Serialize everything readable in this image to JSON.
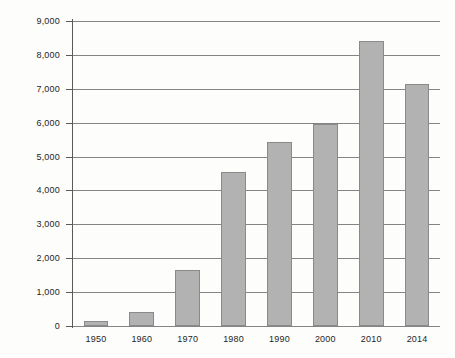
{
  "chart_data": {
    "type": "bar",
    "title": "",
    "xlabel": "",
    "ylabel": "Enrollment (1,000)",
    "categories": [
      "1950",
      "1960",
      "1970",
      "1980",
      "1990",
      "2000",
      "2010",
      "2014"
    ],
    "values": [
      150,
      410,
      1660,
      4540,
      5430,
      5970,
      8400,
      7140
    ],
    "ylim": [
      0,
      9000
    ],
    "ytick_labels": [
      "9,000",
      "8,000",
      "7,000",
      "6,000",
      "5,000",
      "4,000",
      "3,000",
      "2,000",
      "1,000",
      "0"
    ],
    "ytick_values": [
      9000,
      8000,
      7000,
      6000,
      5000,
      4000,
      3000,
      2000,
      1000,
      0
    ],
    "grid": true,
    "legend": "none",
    "colors": {
      "bar_fill": "#b2b2b2",
      "bar_stroke": "#8a8a8a",
      "gridline": "#6e6e6e",
      "axis": "#5a5a5a",
      "background": "#fdfdfb",
      "text": "#1f1f1f"
    }
  }
}
